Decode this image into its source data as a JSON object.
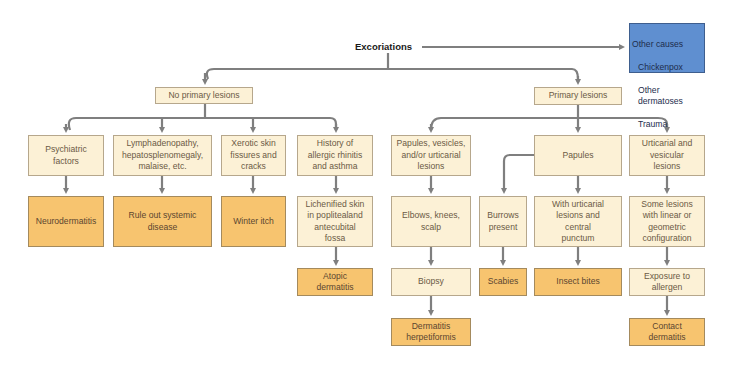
{
  "diagram": {
    "title": "Excoriations",
    "colors": {
      "light_box": "#fcf1d6",
      "diagnosis_box": "#f7c46f",
      "other_box": "#5f8fd0",
      "connector": "#7f7f7f"
    },
    "other_causes": {
      "heading": "Other causes",
      "items": [
        "Chickenpox",
        "Other dermatoses",
        "Trauma"
      ]
    },
    "branches": {
      "no_primary": {
        "label": "No primary lesions",
        "children": [
          {
            "finding": "Psychiatric\nfactors",
            "outcome": "Neurodermatitis"
          },
          {
            "finding": "Lymphadenopathy,\nhepatosplenomegaly,\nmalaise, etc.",
            "outcome": "Rule out systemic\ndisease"
          },
          {
            "finding": "Xerotic skin\nfissures and\ncracks",
            "outcome": "Winter itch"
          },
          {
            "finding": "History of\nallergic rhinitis\nand asthma",
            "step": "Lichenified skin\nin poplitealand\nantecubital\nfossa",
            "outcome": "Atopic\ndermatitis"
          }
        ]
      },
      "primary": {
        "label": "Primary lesions",
        "children": [
          {
            "finding": "Papules, vesicles,\nand/or urticarial\nlesions",
            "step": "Elbows, knees,\nscalp",
            "step2": "Biopsy",
            "outcome": "Dermatitis\nherpetiformis"
          },
          {
            "finding": "Papules",
            "sub": [
              {
                "finding": "Burrows\npresent",
                "outcome": "Scabies"
              },
              {
                "finding": "With urticarial\nlesions and\ncentral\npunctum",
                "outcome": "Insect  bites"
              }
            ]
          },
          {
            "finding": "Urticarial and\nvesicular\nlesions",
            "step": "Some lesions\nwith linear or\ngeometric\nconfiguration",
            "step2": "Exposure to\nallergen",
            "outcome": "Contact\ndermatitis"
          }
        ]
      }
    }
  }
}
